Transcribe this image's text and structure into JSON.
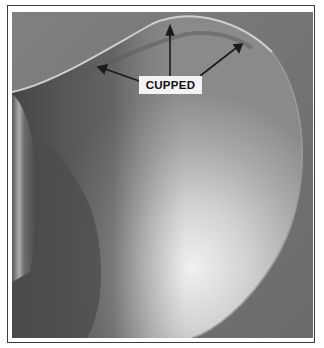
{
  "figure": {
    "annotation": {
      "label": "CUPPED",
      "arrow_count": 3
    },
    "colors": {
      "background": "#7b7b7b",
      "blade_highlight": "#e6e6e6",
      "blade_shadow": "#4a4a4a",
      "label_bg": "#f3f3f3",
      "arrow": "#1a1a1a",
      "frame": "#3a3a3a"
    }
  }
}
